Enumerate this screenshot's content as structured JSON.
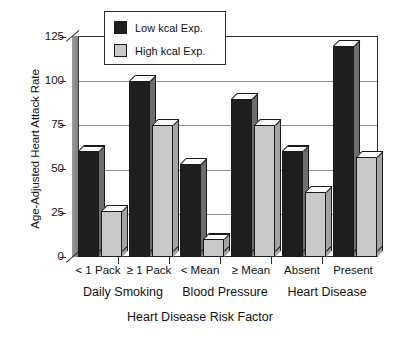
{
  "chart_data": {
    "type": "bar",
    "title": "",
    "xlabel": "Heart Disease Risk Factor",
    "ylabel": "Age-Adjusted Heart Attack Rate",
    "categories": [
      "< 1 Pack",
      "≥ 1 Pack",
      "< Mean",
      "≥ Mean",
      "Absent",
      "Present"
    ],
    "group_labels": [
      "Daily Smoking",
      "Blood Pressure",
      "Heart Disease"
    ],
    "series": [
      {
        "name": "Low kcal Exp.",
        "color": "#1e1e1e",
        "values": [
          60,
          100,
          53,
          90,
          60,
          120
        ]
      },
      {
        "name": "High kcal Exp.",
        "color": "#c9c9c9",
        "values": [
          26,
          75,
          10,
          75,
          37,
          57
        ]
      }
    ],
    "ylim": [
      0,
      125
    ],
    "yticks": [
      0,
      25,
      50,
      75,
      100,
      125
    ],
    "ytick_labels": [
      "0",
      "25",
      "50",
      "75",
      "100",
      "125"
    ],
    "grid": true,
    "legend_position": "top-left-inside",
    "style": "3d-bars"
  },
  "legend": {
    "items": [
      {
        "label": "Low kcal Exp.",
        "color": "#1e1e1e"
      },
      {
        "label": "High kcal Exp.",
        "color": "#c9c9c9"
      }
    ]
  },
  "axes": {
    "y_title": "Age-Adjusted Heart Attack Rate",
    "x_title": "Heart Disease Risk Factor",
    "y_tick_labels": [
      "125",
      "100",
      "75",
      "50",
      "25",
      "0"
    ],
    "x_tick_labels": [
      "< 1 Pack",
      "≥ 1 Pack",
      "< Mean",
      "≥ Mean",
      "Absent",
      "Present"
    ],
    "x_group_labels": [
      "Daily Smoking",
      "Blood Pressure",
      "Heart Disease"
    ]
  }
}
